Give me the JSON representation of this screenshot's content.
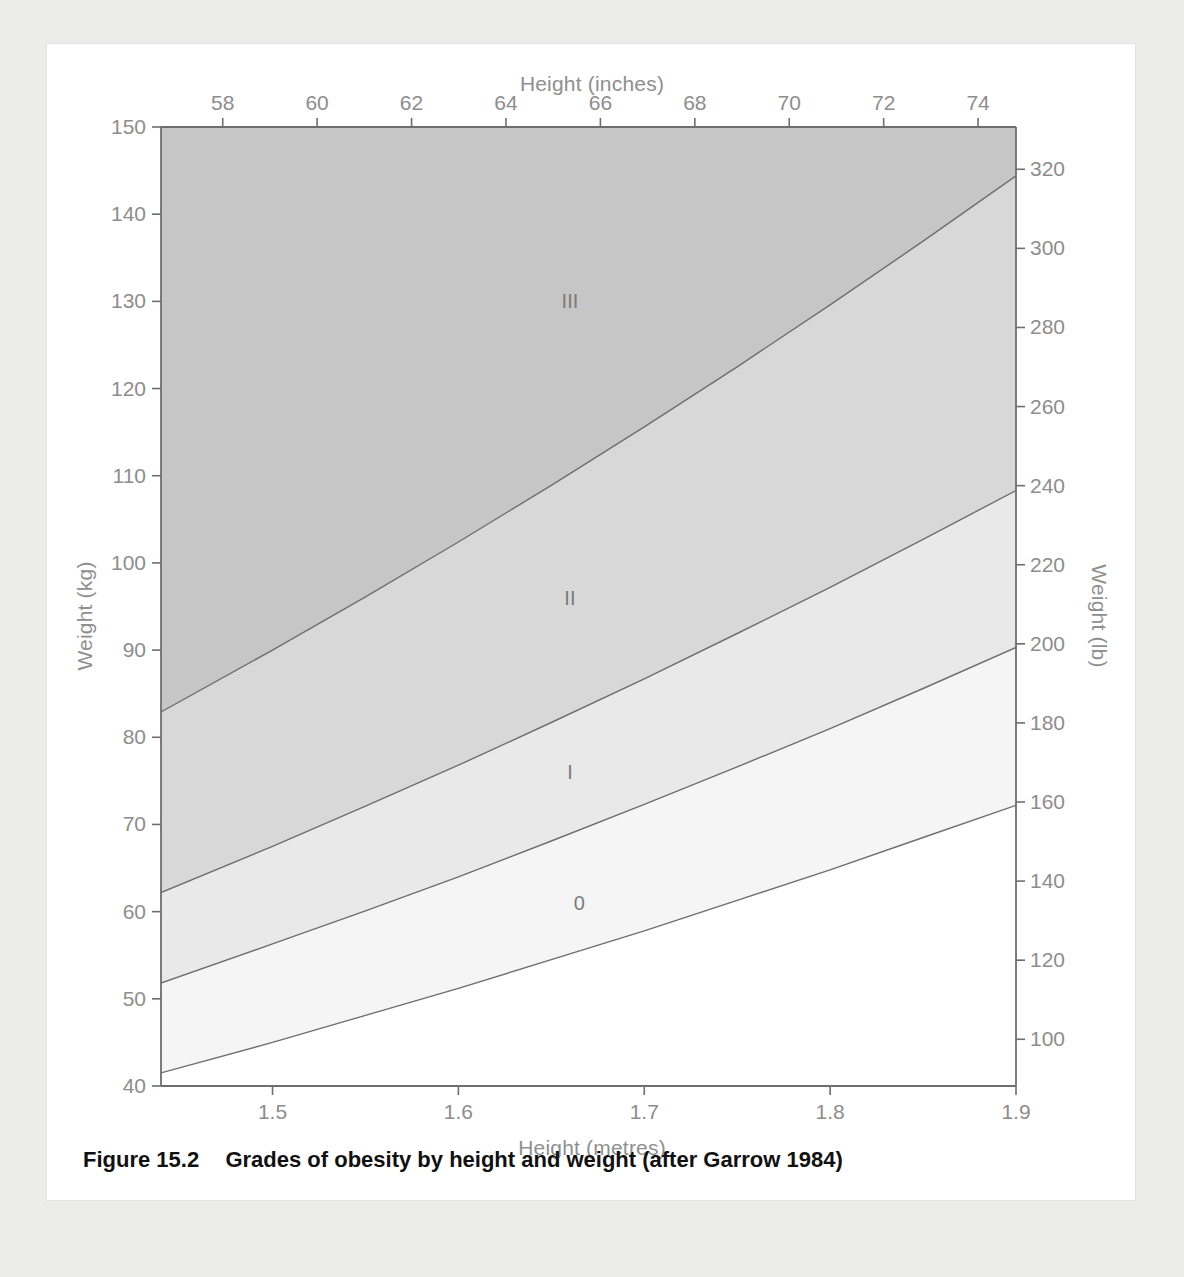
{
  "figure": {
    "number_label": "Figure 15.2",
    "caption_text": "Grades of obesity by height and weight (after Garrow 1984)"
  },
  "chart_data": {
    "type": "area",
    "title": "",
    "xlabel": "Height (metres)",
    "ylabel": "Weight (kg)",
    "xlabel_secondary": "Height (inches)",
    "ylabel_secondary": "Weight (lb)",
    "xlim": [
      1.44,
      1.9
    ],
    "ylim": [
      40,
      150
    ],
    "xlim_secondary_inches": [
      56.7,
      74.8
    ],
    "ylim_secondary_lb": [
      88.2,
      330.7
    ],
    "grid": false,
    "legend": "none",
    "x_ticks": [
      "1.5",
      "1.6",
      "1.7",
      "1.8",
      "1.9"
    ],
    "x_tick_values": [
      1.5,
      1.6,
      1.7,
      1.8,
      1.9
    ],
    "x_ticks_top": [
      "58",
      "60",
      "62",
      "64",
      "66",
      "68",
      "70",
      "72",
      "74"
    ],
    "x_tick_values_top_inches": [
      58,
      60,
      62,
      64,
      66,
      68,
      70,
      72,
      74
    ],
    "y_ticks": [
      "40",
      "50",
      "60",
      "70",
      "80",
      "90",
      "100",
      "110",
      "120",
      "130",
      "140",
      "150"
    ],
    "y_tick_values": [
      40,
      50,
      60,
      70,
      80,
      90,
      100,
      110,
      120,
      130,
      140,
      150
    ],
    "y_ticks_right": [
      "100",
      "120",
      "140",
      "160",
      "180",
      "200",
      "220",
      "240",
      "260",
      "280",
      "300",
      "320"
    ],
    "y_tick_values_right_lb": [
      100,
      120,
      140,
      160,
      180,
      200,
      220,
      240,
      260,
      280,
      300,
      320
    ],
    "boundaries": [
      {
        "name": "grade-0-lower-bound",
        "bmi": 20,
        "x": [
          1.44,
          1.5,
          1.55,
          1.6,
          1.65,
          1.7,
          1.75,
          1.8,
          1.85,
          1.9
        ],
        "y": [
          41.5,
          45.0,
          48.1,
          51.2,
          54.5,
          57.8,
          61.3,
          64.8,
          68.5,
          72.2
        ]
      },
      {
        "name": "grade-0-to-I",
        "bmi": 25,
        "x": [
          1.44,
          1.5,
          1.55,
          1.6,
          1.65,
          1.7,
          1.75,
          1.8,
          1.85,
          1.9
        ],
        "y": [
          51.8,
          56.3,
          60.1,
          64.0,
          68.1,
          72.3,
          76.6,
          81.0,
          85.6,
          90.3
        ]
      },
      {
        "name": "grade-I-to-II",
        "bmi": 30,
        "x": [
          1.44,
          1.5,
          1.55,
          1.6,
          1.65,
          1.7,
          1.75,
          1.8,
          1.85,
          1.9
        ],
        "y": [
          62.2,
          67.5,
          72.1,
          76.8,
          81.7,
          86.7,
          91.9,
          97.2,
          102.7,
          108.3
        ]
      },
      {
        "name": "grade-II-to-III",
        "bmi": 40,
        "x": [
          1.44,
          1.5,
          1.55,
          1.6,
          1.65,
          1.7,
          1.75,
          1.8,
          1.85,
          1.9
        ],
        "y": [
          82.9,
          90.0,
          96.1,
          102.4,
          108.9,
          115.6,
          122.5,
          129.6,
          136.9,
          144.4
        ]
      }
    ],
    "bands": [
      {
        "label": "III",
        "name": "grade-iii-region",
        "color": "#c6c6c6",
        "label_x": 1.66,
        "label_y": 130
      },
      {
        "label": "II",
        "name": "grade-ii-region",
        "color": "#d8d8d8",
        "label_x": 1.66,
        "label_y": 96
      },
      {
        "label": "I",
        "name": "grade-i-region",
        "color": "#e9e9e9",
        "label_x": 1.66,
        "label_y": 76
      },
      {
        "label": "0",
        "name": "grade-0-region",
        "color": "#f5f5f5",
        "label_x": 1.665,
        "label_y": 61
      }
    ],
    "colors": {
      "axis": "#6e6e6e",
      "tick_text": "#8d8d8d",
      "curve": "#6e6e6e",
      "band_iii": "#c6c6c6",
      "band_ii": "#d8d8d8",
      "band_i": "#e9e9e9",
      "band_0": "#f5f5f5",
      "background": "#ffffff",
      "page": "#ececeb"
    }
  }
}
